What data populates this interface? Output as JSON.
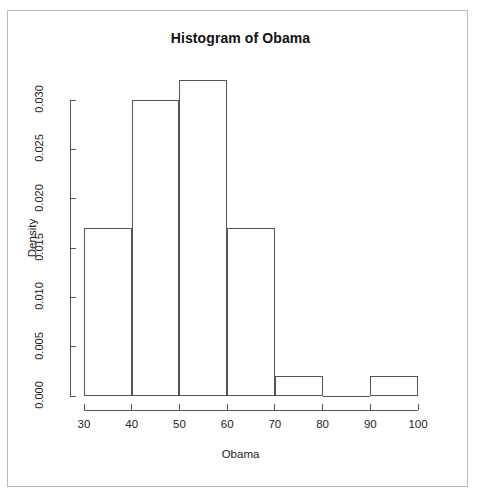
{
  "figure": {
    "title": "Histogram of Obama",
    "background_color": "#ffffff",
    "frame_color": "#b9b9b9",
    "line_color": "#555555"
  },
  "chart_data": {
    "type": "bar",
    "subtype": "histogram",
    "title": "Histogram of Obama",
    "xlabel": "Obama",
    "ylabel": "Density",
    "categories": [
      "30-40",
      "40-50",
      "50-60",
      "60-70",
      "70-80",
      "80-90",
      "90-100"
    ],
    "bin_edges": [
      30,
      40,
      50,
      60,
      70,
      80,
      90,
      100
    ],
    "bin_width": 10,
    "values": [
      0.017,
      0.03,
      0.032,
      0.017,
      0.002,
      0.0,
      0.002
    ],
    "series": [
      {
        "name": "Density",
        "values": [
          0.017,
          0.03,
          0.032,
          0.017,
          0.002,
          0.0,
          0.002
        ]
      }
    ],
    "xlim": [
      30,
      100
    ],
    "ylim": [
      0.0,
      0.032
    ],
    "xticks": [
      30,
      40,
      50,
      60,
      70,
      80,
      90,
      100
    ],
    "xtick_labels": [
      "30",
      "40",
      "50",
      "60",
      "70",
      "80",
      "90",
      "100"
    ],
    "yticks": [
      0.0,
      0.005,
      0.01,
      0.015,
      0.02,
      0.025,
      0.03
    ],
    "ytick_labels": [
      "0.000",
      "0.005",
      "0.010",
      "0.015",
      "0.020",
      "0.025",
      "0.030"
    ],
    "grid": false,
    "legend": null,
    "bar_fill": "none",
    "bar_stroke": "#555555"
  },
  "axis": {
    "x_title": "Obama",
    "y_title": "Density"
  }
}
